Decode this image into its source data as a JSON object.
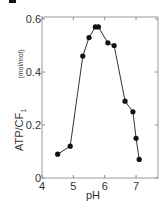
{
  "chart_data": {
    "type": "line",
    "title": "",
    "xlabel": "pH",
    "ylabel": "ATP/CF1",
    "ylabel_unit": "(mol/mol)",
    "xlim": [
      4,
      7.7
    ],
    "ylim": [
      0,
      0.62
    ],
    "x_ticks": [
      4,
      5,
      6,
      7
    ],
    "x_tick_labels": [
      "4",
      "5",
      "6",
      "7"
    ],
    "y_ticks": [
      0,
      0.2,
      0.4,
      0.6
    ],
    "y_tick_labels": [
      "0",
      "0.2",
      "0.4",
      "0.6"
    ],
    "grid": false,
    "legend": null,
    "series": [
      {
        "name": "ATP/CF1",
        "marker": "filled-circle",
        "color": "#111111",
        "x": [
          4.5,
          4.9,
          5.3,
          5.5,
          5.7,
          5.8,
          6.1,
          6.3,
          6.65,
          6.9,
          7.0,
          7.1
        ],
        "y": [
          0.09,
          0.12,
          0.46,
          0.53,
          0.57,
          0.57,
          0.51,
          0.5,
          0.29,
          0.25,
          0.15,
          0.07
        ]
      }
    ]
  },
  "labels": {
    "x_axis": "pH",
    "y_axis": "ATP/CF",
    "y_axis_sub": "1",
    "y_unit": "(mol/mol)"
  }
}
